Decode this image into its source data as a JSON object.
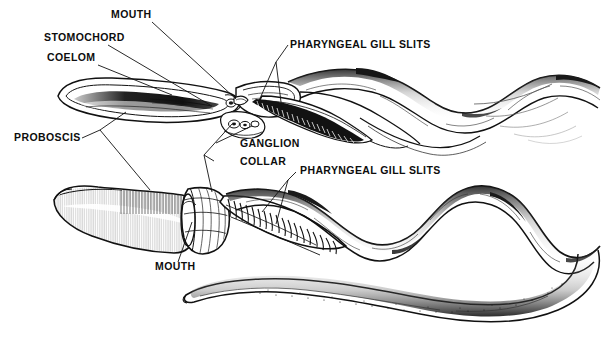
{
  "figure": {
    "background_color": "#ffffff",
    "ink_color": "#111111",
    "width": 615,
    "height": 342
  },
  "labels": {
    "mouth_top": "MOUTH",
    "stomochord": "STOMOCHORD",
    "coelom": "COELOM",
    "pharyngeal_gill_slits_top": "PHARYNGEAL GILL SLITS",
    "proboscis": "PROBOSCIS",
    "ganglion": "GANGLION",
    "collar": "COLLAR",
    "pharyngeal_gill_slits_bottom": "PHARYNGEAL GILL SLITS",
    "mouth_bottom": "MOUTH"
  },
  "specimens": [
    {
      "name": "upper-sectional-view",
      "view": "cut-away sagittal section",
      "parts": [
        "proboscis",
        "coelom",
        "stomochord",
        "mouth",
        "collar",
        "ganglion",
        "pharyngeal gill slits",
        "trunk"
      ]
    },
    {
      "name": "lower-external-view",
      "view": "external lateral view",
      "parts": [
        "proboscis",
        "collar",
        "mouth",
        "pharyngeal gill slits",
        "trunk",
        "tail"
      ]
    }
  ]
}
